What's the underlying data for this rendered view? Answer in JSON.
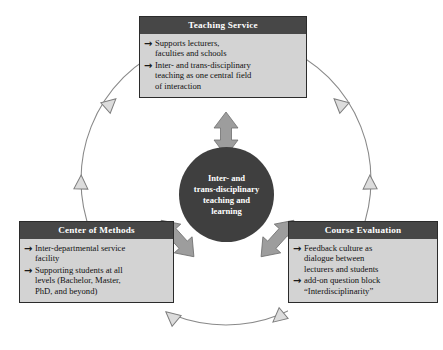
{
  "diagram": {
    "colors": {
      "header_bg": "#474747",
      "body_bg": "#d3d3d3",
      "circle_bg": "#3f3f3f",
      "connector_arrow": "#9a9a9a",
      "ring_line": "#808080",
      "ring_arrowhead_fill": "#d9d9d9",
      "text_dark": "#111111",
      "text_light": "#ffffff"
    },
    "center": {
      "label": "Inter- and trans-disciplinary teaching and learning",
      "lines": [
        "Inter- and",
        "trans-disciplinary",
        "teaching and",
        "learning"
      ]
    },
    "bullet_glyph": "→",
    "nodes": [
      {
        "id": "teaching-service",
        "title": "Teaching Service",
        "bullets": [
          "Supports lecturers, faculties and schools",
          "Inter- and trans-disciplinary teaching as one central field of interaction"
        ],
        "bullet_lines": [
          [
            "Supports lecturers,",
            "faculties and schools"
          ],
          [
            "Inter- and trans-disciplinary",
            "teaching as one central field",
            "of interaction"
          ]
        ]
      },
      {
        "id": "center-of-methods",
        "title": "Center of Methods",
        "bullets": [
          "Inter-departmental service facility",
          "Supporting students at all levels (Bachelor, Master, PhD, and beyond)"
        ],
        "bullet_lines": [
          [
            "Inter-departmental service",
            "facility"
          ],
          [
            "Supporting students at all",
            "levels (Bachelor, Master,",
            "PhD, and beyond)"
          ]
        ]
      },
      {
        "id": "course-evaluation",
        "title": "Course Evaluation",
        "bullets": [
          "Feedback culture as dialogue between lecturers and students",
          "add-on question block “Interdisciplinarity”"
        ],
        "bullet_lines": [
          [
            "Feedback culture as",
            "dialogue between",
            "lecturers and students"
          ],
          [
            "add-on question block",
            "“Interdisciplinarity”"
          ]
        ]
      }
    ],
    "connectors": [
      {
        "id": "teaching-to-center",
        "from": "teaching-service",
        "to": "center",
        "style": "double-headed",
        "direction": "vertical"
      },
      {
        "id": "methods-to-center",
        "from": "center-of-methods",
        "to": "center",
        "style": "double-headed",
        "direction": "diagonal-up-right"
      },
      {
        "id": "evaluation-to-center",
        "from": "course-evaluation",
        "to": "center",
        "style": "double-headed",
        "direction": "diagonal-up-left"
      }
    ],
    "cycle_ring": {
      "style": "thin circular line with outlined triangular arrowheads",
      "arrowhead_count": 6
    }
  }
}
